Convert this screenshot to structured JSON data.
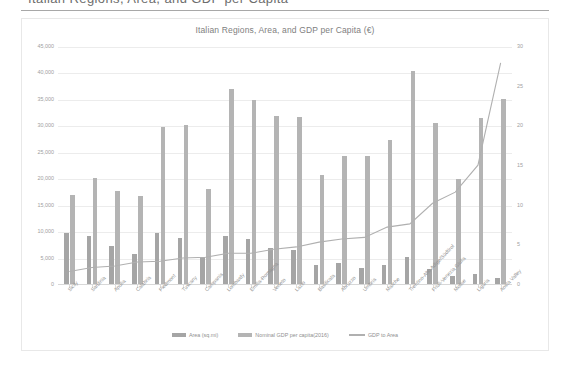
{
  "page": {
    "clipped_header_text": "Italian Regions, Area, and GDP per Capita"
  },
  "chart_data": {
    "type": "bar",
    "title": "Italian Regions, Area, and GDP per Capita (€)",
    "xlabel": "",
    "ylabel": "",
    "ylim": [
      0,
      45000
    ],
    "y2lim": [
      0,
      30
    ],
    "grid": true,
    "legend_position": "bottom",
    "y_ticks": [
      "0",
      "5,000",
      "10,000",
      "15,000",
      "20,000",
      "25,000",
      "30,000",
      "35,000",
      "40,000",
      "45,000"
    ],
    "y2_ticks": [
      "0",
      "5",
      "10",
      "15",
      "20",
      "25",
      "30"
    ],
    "categories": [
      "Sicily",
      "Sardinia",
      "Apulia",
      "Calabria",
      "Piedmont",
      "Tuscany",
      "Campania",
      "Lombardy",
      "Emilia-Romagna",
      "Veneto",
      "Lazio",
      "Basilicata",
      "Abruzzo",
      "Umbria",
      "Marche",
      "Trentino-Alto Adige/Südtirol",
      "Friuli-Venezia Giulia",
      "Molise",
      "Liguria",
      "Aosta Valley"
    ],
    "series": [
      {
        "name": "Area (sq.mi)",
        "axis": "left",
        "color": "#a5a5a5",
        "values": [
          9927,
          9301,
          7470,
          5823,
          9808,
          8878,
          5247,
          9206,
          8688,
          7089,
          6643,
          3858,
          4167,
          3265,
          3743,
          5253,
          2969,
          1713,
          2092,
          1263
        ]
      },
      {
        "name": "Nominal GDP per capita(2016)",
        "axis": "left",
        "color": "#b4b4b4",
        "values": [
          17000,
          20300,
          17800,
          16800,
          29800,
          30300,
          18100,
          37000,
          34900,
          32000,
          31800,
          20800,
          24300,
          24400,
          27400,
          40400,
          30700,
          20000,
          31500,
          35100
        ]
      },
      {
        "name": "GDP to Area",
        "axis": "right",
        "type": "line",
        "color": "#b0b0b0",
        "values": [
          1.7,
          2.2,
          2.4,
          2.9,
          3.0,
          3.4,
          3.5,
          4.0,
          4.0,
          4.5,
          4.8,
          5.4,
          5.8,
          6.0,
          7.3,
          7.7,
          10.3,
          11.7,
          15.1,
          28.0
        ]
      }
    ]
  }
}
